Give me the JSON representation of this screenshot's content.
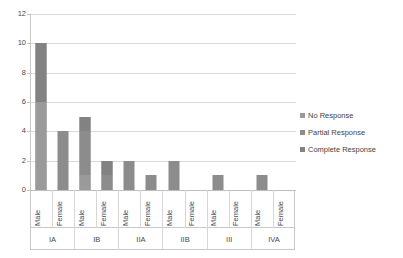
{
  "chart_data": {
    "type": "bar",
    "title": "",
    "subtitle": "",
    "xlabel": "",
    "ylabel": "",
    "ylim": [
      0,
      12
    ],
    "yticks": [
      0,
      2,
      4,
      6,
      8,
      10,
      12
    ],
    "ytick_labels": [
      "0",
      "2",
      "4",
      "6",
      "8",
      "10",
      "12"
    ],
    "grid": true,
    "stacked": true,
    "legend_position": "right",
    "categories": [
      "Male",
      "Female",
      "Male",
      "Female",
      "Male",
      "Female",
      "Male",
      "Female",
      "Male",
      "Female",
      "Male",
      "Female"
    ],
    "groups": [
      {
        "label": "IA",
        "span": 2
      },
      {
        "label": "IB",
        "span": 2
      },
      {
        "label": "IIA",
        "span": 2
      },
      {
        "label": "IIB",
        "span": 2
      },
      {
        "label": "III",
        "span": 2
      },
      {
        "label": "IVA",
        "span": 2
      }
    ],
    "series": [
      {
        "name": "No Response",
        "color": "#9a9a9a",
        "values": [
          6,
          0,
          1,
          0,
          0,
          0,
          0,
          0,
          0,
          0,
          0,
          0
        ]
      },
      {
        "name": "Partial Response",
        "color": "#8c8c8c",
        "values": [
          0,
          4,
          3,
          1,
          2,
          1,
          2,
          0,
          1,
          0,
          1,
          0
        ]
      },
      {
        "name": "Complete Response",
        "color": "#828282",
        "values": [
          4,
          0,
          1,
          1,
          0,
          0,
          0,
          0,
          0,
          0,
          0,
          0
        ]
      }
    ],
    "totals": [
      10,
      4,
      5,
      2,
      2,
      1,
      2,
      0,
      1,
      0,
      1,
      0
    ]
  },
  "legend": {
    "items": [
      {
        "label": "No Response"
      },
      {
        "label": "Partial Response"
      },
      {
        "label": "Complete Response"
      }
    ]
  }
}
